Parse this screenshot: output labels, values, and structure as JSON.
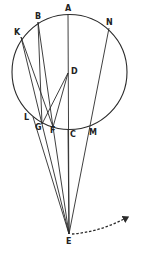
{
  "diagram": {
    "type": "geometric-optics-construction",
    "circle": {
      "cx": 69.5,
      "cy": 72,
      "r": 57.5
    },
    "points": {
      "A": {
        "x": 68,
        "y": 14,
        "label": "A",
        "lx": 65,
        "ly": 11
      },
      "B": {
        "x": 38,
        "y": 22,
        "label": "B",
        "lx": 35,
        "ly": 19
      },
      "K": {
        "x": 21,
        "y": 37,
        "label": "K",
        "lx": 14,
        "ly": 35
      },
      "N": {
        "x": 109,
        "y": 28,
        "label": "N",
        "lx": 106,
        "ly": 25
      },
      "D": {
        "x": 68,
        "y": 73,
        "label": "D",
        "lx": 71,
        "ly": 74
      },
      "L": {
        "x": 33,
        "y": 117,
        "label": "L",
        "lx": 24,
        "ly": 120
      },
      "G": {
        "x": 42,
        "y": 124,
        "label": "G",
        "lx": 35,
        "ly": 130
      },
      "F": {
        "x": 53,
        "y": 127,
        "label": "F",
        "lx": 50,
        "ly": 133
      },
      "C": {
        "x": 68,
        "y": 129,
        "label": "C",
        "lx": 70,
        "ly": 137
      },
      "M": {
        "x": 90,
        "y": 127,
        "label": "M",
        "lx": 89,
        "ly": 135
      },
      "E": {
        "x": 69,
        "y": 234,
        "label": "E",
        "lx": 66,
        "ly": 244
      }
    },
    "segments": [
      [
        "A",
        "E"
      ],
      [
        "B",
        "G"
      ],
      [
        "B",
        "F"
      ],
      [
        "K",
        "G"
      ],
      [
        "K",
        "F"
      ],
      [
        "N",
        "E"
      ],
      [
        "D",
        "G"
      ],
      [
        "D",
        "F"
      ],
      [
        "L",
        "E"
      ],
      [
        "G",
        "E"
      ],
      [
        "F",
        "E"
      ],
      [
        "C",
        "E"
      ]
    ],
    "arrow": {
      "style": "dashed",
      "from": [
        72,
        234
      ],
      "control": [
        100,
        232
      ],
      "to": [
        128,
        217
      ]
    },
    "colors": {
      "stroke": "#2a2a2a",
      "background": "#ffffff"
    }
  }
}
